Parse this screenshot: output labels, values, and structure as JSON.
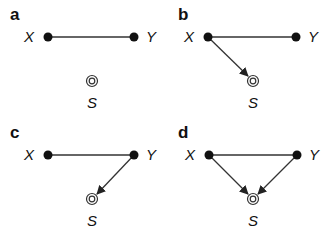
{
  "figure": {
    "type": "causal-graph-panels",
    "colors": {
      "node": "#111111",
      "edge": "#333333",
      "background": "#ffffff"
    },
    "panels": [
      {
        "id": "a",
        "label": "a",
        "nodes": {
          "X": "X",
          "Y": "Y",
          "S": "S"
        },
        "edges": [
          {
            "from": "X",
            "to": "Y",
            "directed": false
          }
        ]
      },
      {
        "id": "b",
        "label": "b",
        "nodes": {
          "X": "X",
          "Y": "Y",
          "S": "S"
        },
        "edges": [
          {
            "from": "X",
            "to": "Y",
            "directed": false
          },
          {
            "from": "X",
            "to": "S",
            "directed": true
          }
        ]
      },
      {
        "id": "c",
        "label": "c",
        "nodes": {
          "X": "X",
          "Y": "Y",
          "S": "S"
        },
        "edges": [
          {
            "from": "X",
            "to": "Y",
            "directed": false
          },
          {
            "from": "Y",
            "to": "S",
            "directed": true
          }
        ]
      },
      {
        "id": "d",
        "label": "d",
        "nodes": {
          "X": "X",
          "Y": "Y",
          "S": "S"
        },
        "edges": [
          {
            "from": "X",
            "to": "Y",
            "directed": false
          },
          {
            "from": "X",
            "to": "S",
            "directed": true
          },
          {
            "from": "Y",
            "to": "S",
            "directed": true
          }
        ]
      }
    ],
    "node_types": {
      "X": "filled-dot",
      "Y": "filled-dot",
      "S": "double-circle-selection-node"
    }
  }
}
